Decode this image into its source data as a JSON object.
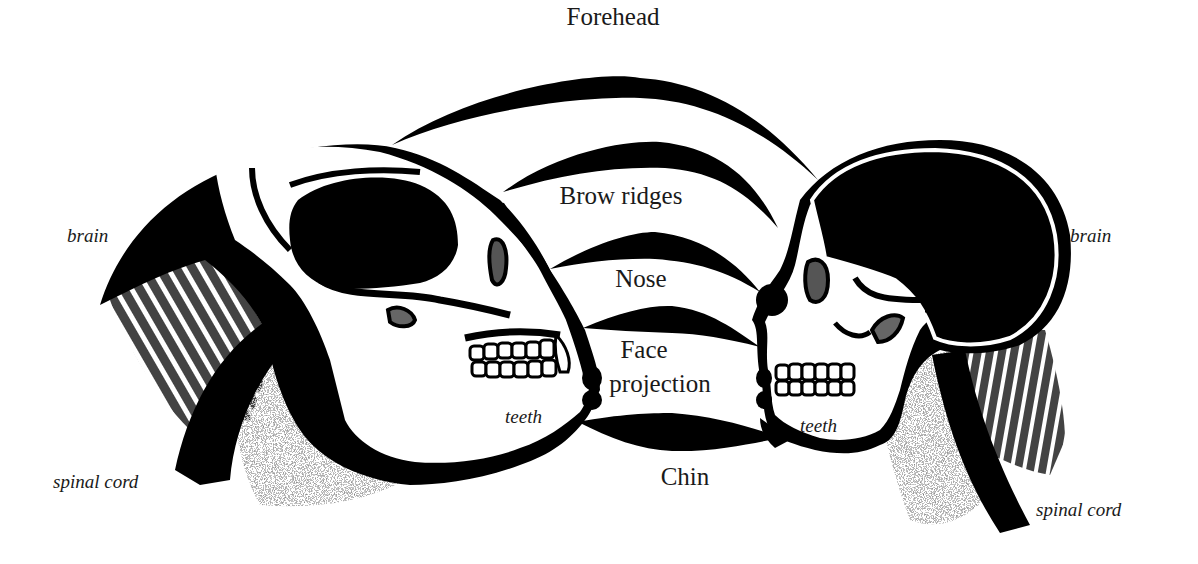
{
  "figure": {
    "colors": {
      "ink": "#000000",
      "paper": "#ffffff",
      "text": "#1a1a1a",
      "stipple": "#3a3a3a"
    }
  },
  "comparison_labels": {
    "forehead": "Forehead",
    "brow_ridges": "Brow ridges",
    "nose": "Nose",
    "face_projection_line1": "Face",
    "face_projection_line2": "projection",
    "chin": "Chin"
  },
  "left_skull": {
    "name": "ape",
    "brain": "brain",
    "teeth": "teeth",
    "spinal_cord": "spinal cord"
  },
  "right_skull": {
    "name": "human",
    "brain": "brain",
    "teeth": "teeth",
    "spinal_cord": "spinal cord"
  }
}
